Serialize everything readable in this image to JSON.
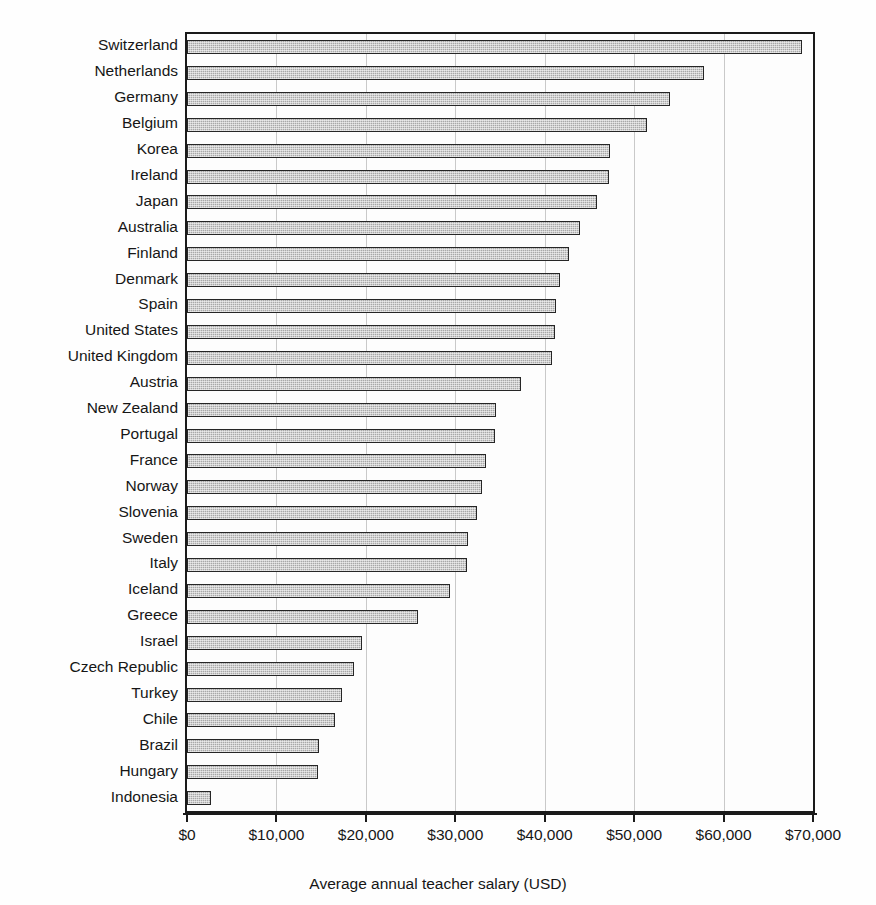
{
  "chart_data": {
    "type": "bar",
    "orientation": "horizontal",
    "title": "",
    "xlabel": "Average annual teacher salary (USD)",
    "ylabel": "",
    "xlim": [
      0,
      70000
    ],
    "xticks": [
      0,
      10000,
      20000,
      30000,
      40000,
      50000,
      60000,
      70000
    ],
    "xticklabels": [
      "$0",
      "$10,000",
      "$20,000",
      "$30,000",
      "$40,000",
      "$50,000",
      "$60,000",
      "$70,000"
    ],
    "grid": "vertical-only",
    "legend": "none",
    "bar_color": "#a8a8a8",
    "bar_edge_color": "#262626",
    "gridline_color": "#c9c9c9",
    "axis_color": "#1a1a1a",
    "categories": [
      "Switzerland",
      "Netherlands",
      "Germany",
      "Belgium",
      "Korea",
      "Ireland",
      "Japan",
      "Australia",
      "Finland",
      "Denmark",
      "Spain",
      "United States",
      "United Kingdom",
      "Austria",
      "New Zealand",
      "Portugal",
      "France",
      "Norway",
      "Slovenia",
      "Sweden",
      "Italy",
      "Iceland",
      "Greece",
      "Israel",
      "Czech Republic",
      "Turkey",
      "Chile",
      "Brazil",
      "Hungary",
      "Indonesia"
    ],
    "values": [
      68800,
      57800,
      54000,
      51400,
      47300,
      47200,
      45800,
      44000,
      42700,
      41700,
      41300,
      41200,
      40800,
      37400,
      34600,
      34400,
      33400,
      33000,
      32400,
      31400,
      31300,
      29400,
      25800,
      19600,
      18700,
      17300,
      16500,
      14800,
      14600,
      2700
    ]
  }
}
